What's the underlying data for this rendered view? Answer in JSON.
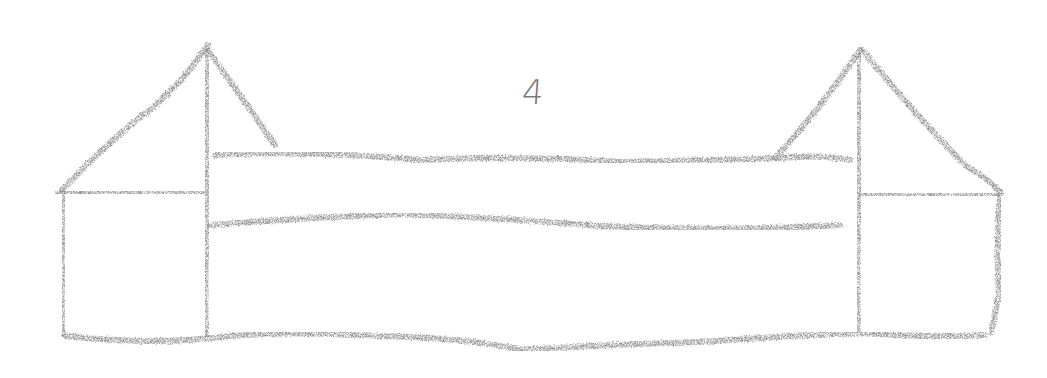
{
  "sketch": {
    "label": "4",
    "stroke_color": "#8a8a8a",
    "background": "#ffffff",
    "medium": "pencil-crayon"
  },
  "shapes": {
    "left_tower": {
      "peak": [
        208,
        45
      ],
      "eave_left": [
        62,
        190
      ],
      "wall_right_x": 206,
      "base_y": 335
    },
    "right_tower": {
      "peak": [
        860,
        50
      ],
      "eave_right": [
        1000,
        190
      ],
      "wall_left_x": 858,
      "base_y": 330
    },
    "middle_section": {
      "top_y": 155,
      "middle_y": 220,
      "bottom_y": 340
    }
  }
}
